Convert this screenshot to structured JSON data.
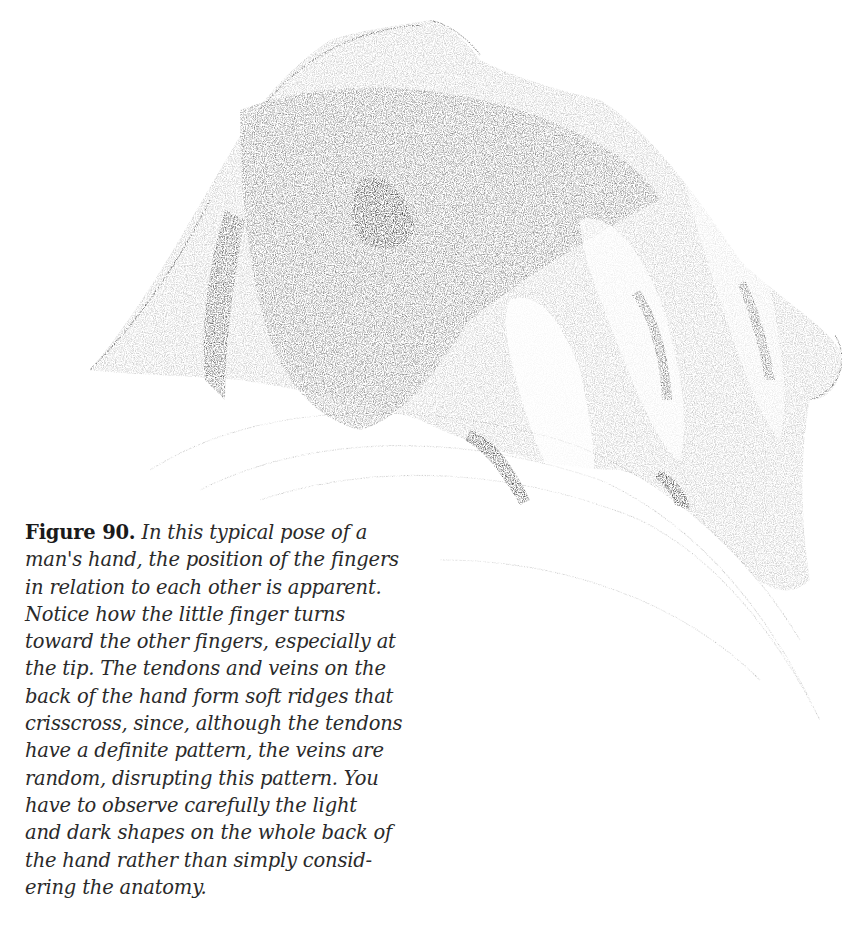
{
  "figure": {
    "label": "Figure 90.",
    "caption_lines": [
      "In this typical pose of a",
      "man's hand, the position of the fingers",
      "in relation to each other is apparent.",
      "Notice how the little finger turns",
      "toward the other fingers, especially at",
      "the tip. The tendons and veins on the",
      "back of the hand form soft ridges that",
      "crisscross, since, although the tendons",
      "have a definite pattern, the veins are",
      "random, disrupting this pattern. You",
      "have to observe carefully the light",
      "and dark shapes on the whole back of",
      "the hand rather than simply consid-",
      "ering the anatomy."
    ]
  },
  "colors": {
    "background": "#ffffff",
    "text": "#2a2a2a",
    "pencil_dark": "#3a3a3a",
    "pencil_mid": "#7a7a7a",
    "pencil_light": "#b5b5b5"
  }
}
